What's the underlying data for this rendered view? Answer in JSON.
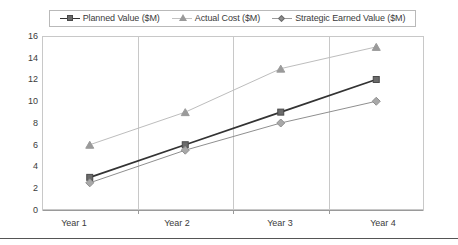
{
  "chart_data": {
    "type": "line",
    "title": "",
    "xlabel": "",
    "ylabel": "",
    "categories": [
      "Year 1",
      "Year 2",
      "Year 3",
      "Year 4"
    ],
    "ylim": [
      0,
      16
    ],
    "ytick_values": [
      0,
      2,
      4,
      6,
      8,
      10,
      12,
      14,
      16
    ],
    "ytick_labels": [
      "0",
      "2",
      "4",
      "6",
      "8",
      "10",
      "12",
      "14",
      "16"
    ],
    "grid": "vertical-only",
    "legend_position": "top-center",
    "series": [
      {
        "name": "Planned Value ($M)",
        "marker": "square",
        "color": "#4a4a4a",
        "line_color": "#333333",
        "values": [
          3,
          6,
          9,
          12
        ]
      },
      {
        "name": "Actual Cost ($M)",
        "marker": "triangle",
        "color": "#9a9a9a",
        "line_color": "#bdbdbd",
        "values": [
          6,
          9,
          13,
          15
        ]
      },
      {
        "name": "Strategic Earned Value ($M)",
        "marker": "diamond",
        "color": "#8f8f8f",
        "line_color": "#8f8f8f",
        "values": [
          2.5,
          5.5,
          8,
          10
        ]
      }
    ]
  },
  "legend": {
    "entries": [
      {
        "label": "Planned Value ($M)",
        "marker": "square-marker-icon"
      },
      {
        "label": "Actual Cost ($M)",
        "marker": "triangle-marker-icon"
      },
      {
        "label": "Strategic Earned Value ($M)",
        "marker": "diamond-marker-icon"
      }
    ]
  },
  "axes": {
    "y_labels": [
      "16",
      "14",
      "12",
      "10",
      "8",
      "6",
      "4",
      "2",
      "0"
    ],
    "x_labels": [
      "Year 1",
      "Year 2",
      "Year 3",
      "Year 4"
    ]
  }
}
